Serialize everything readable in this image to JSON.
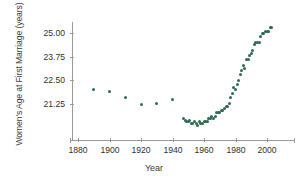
{
  "chart_data": {
    "type": "scatter",
    "title": "",
    "xlabel": "Year",
    "ylabel": "Women's Age at First Marriage (years)",
    "xlim": [
      1874,
      2014
    ],
    "ylim": [
      19.7,
      25.6
    ],
    "xticks": [
      1880,
      1900,
      1920,
      1940,
      1960,
      1980,
      2000
    ],
    "yticks": [
      21.25,
      22.5,
      23.75,
      25.0
    ],
    "ytick_labels": [
      "21.25",
      "22.50",
      "23.75",
      "25.00"
    ],
    "xtick_labels": [
      "1880",
      "1900",
      "1920",
      "1940",
      "1960",
      "1980",
      "2000"
    ],
    "grid": false,
    "legend": null,
    "marker_color": "#2e6b51",
    "axis_color": "#9a9a9a",
    "series": [
      {
        "name": "Median age at first marriage, women",
        "x": [
          1890,
          1900,
          1910,
          1920,
          1930,
          1940,
          1947,
          1948,
          1949,
          1950,
          1951,
          1952,
          1953,
          1954,
          1955,
          1956,
          1957,
          1958,
          1959,
          1960,
          1961,
          1962,
          1963,
          1964,
          1965,
          1966,
          1967,
          1968,
          1969,
          1970,
          1971,
          1972,
          1973,
          1974,
          1975,
          1976,
          1977,
          1978,
          1979,
          1980,
          1981,
          1982,
          1983,
          1984,
          1985,
          1986,
          1987,
          1988,
          1989,
          1990,
          1991,
          1992,
          1993,
          1994,
          1995,
          1996,
          1997,
          1998,
          1999,
          2000,
          2001,
          2002,
          2003
        ],
        "y": [
          22.0,
          21.9,
          21.6,
          21.2,
          21.3,
          21.5,
          20.5,
          20.4,
          20.3,
          20.3,
          20.4,
          20.2,
          20.2,
          20.3,
          20.2,
          20.1,
          20.3,
          20.2,
          20.2,
          20.3,
          20.3,
          20.3,
          20.5,
          20.5,
          20.6,
          20.5,
          20.6,
          20.8,
          20.8,
          20.8,
          20.9,
          20.9,
          21.0,
          21.1,
          21.1,
          21.3,
          21.6,
          21.8,
          22.1,
          22.0,
          22.3,
          22.5,
          22.8,
          23.0,
          23.3,
          23.1,
          23.6,
          23.6,
          23.8,
          23.9,
          24.1,
          24.4,
          24.5,
          24.5,
          24.5,
          24.8,
          25.0,
          25.0,
          25.1,
          25.1,
          25.1,
          25.3,
          25.3
        ]
      }
    ]
  },
  "axes": {
    "y_title": "Women's Age at First Marriage (years)",
    "x_title": "Year"
  }
}
